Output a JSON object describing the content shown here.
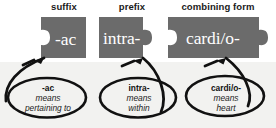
{
  "diagram": {
    "title_row": [
      {
        "id": "suffix",
        "label": "suffix"
      },
      {
        "id": "prefix",
        "label": "prefix"
      },
      {
        "id": "combining-form",
        "label": "combining form"
      }
    ],
    "pieces": [
      {
        "id": "suffix-piece",
        "word": "-ac",
        "left_edge": "notch",
        "right_edge": "flat",
        "fill": "#6b6b6b",
        "text_color": "#ffffff"
      },
      {
        "id": "prefix-piece",
        "word": "intra-",
        "left_edge": "flat",
        "right_edge": "tab",
        "fill": "#6b6b6b",
        "text_color": "#ffffff"
      },
      {
        "id": "combining-form-piece",
        "word": "cardi/o-",
        "left_edge": "notch",
        "right_edge": "tab",
        "fill": "#6b6b6b",
        "text_color": "#ffffff"
      }
    ],
    "callouts": [
      {
        "id": "callout-ac",
        "term": "-ac",
        "connector": "means",
        "definition": "pertaining to"
      },
      {
        "id": "callout-intra",
        "term": "intra-",
        "connector": "means",
        "definition": "within"
      },
      {
        "id": "callout-cardio",
        "term": "cardi/o-",
        "connector": "means",
        "definition": "heart"
      }
    ],
    "colors": {
      "piece_fill": "#6b6b6b",
      "ink": "#111111",
      "page_background": "#f2f2f0",
      "upper_background": "#ffffff"
    }
  }
}
